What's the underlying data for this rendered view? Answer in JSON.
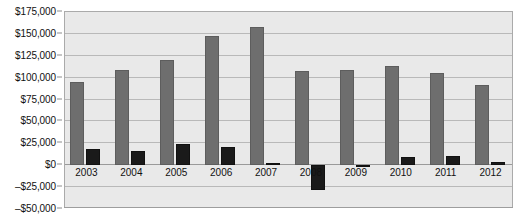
{
  "chart_data": {
    "type": "bar",
    "title": "",
    "subtitle": "",
    "xlabel": "",
    "ylabel": "",
    "categories": [
      "2003",
      "2004",
      "2005",
      "2006",
      "2007",
      "2008",
      "2009",
      "2010",
      "2011",
      "2012"
    ],
    "series": [
      {
        "name": "Revenue",
        "color": "#6e6e6e",
        "values": [
          95000,
          109000,
          120000,
          148000,
          158000,
          108000,
          109000,
          113000,
          105000,
          92000
        ]
      },
      {
        "name": "Net Income",
        "color": "#1a1a1a",
        "values": [
          18000,
          16000,
          24000,
          21000,
          2000,
          -28000,
          500,
          9000,
          10000,
          4000
        ]
      }
    ],
    "ylim": [
      -50000,
      175000
    ],
    "ytick_values": [
      175000,
      150000,
      125000,
      100000,
      75000,
      50000,
      25000,
      0,
      -25000,
      -50000
    ],
    "ytick_labels": [
      "$175,000",
      "$150,000",
      "$125,000",
      "$100,000",
      "$75,000",
      "$50,000",
      "$25,000",
      "$0",
      "–$25,000",
      "–$50,000"
    ],
    "grid": true,
    "legend": "none",
    "plot_background": "#e9e9e9",
    "gridline_color": "#b9b9b9",
    "axis_color": "#9a9a9a"
  }
}
